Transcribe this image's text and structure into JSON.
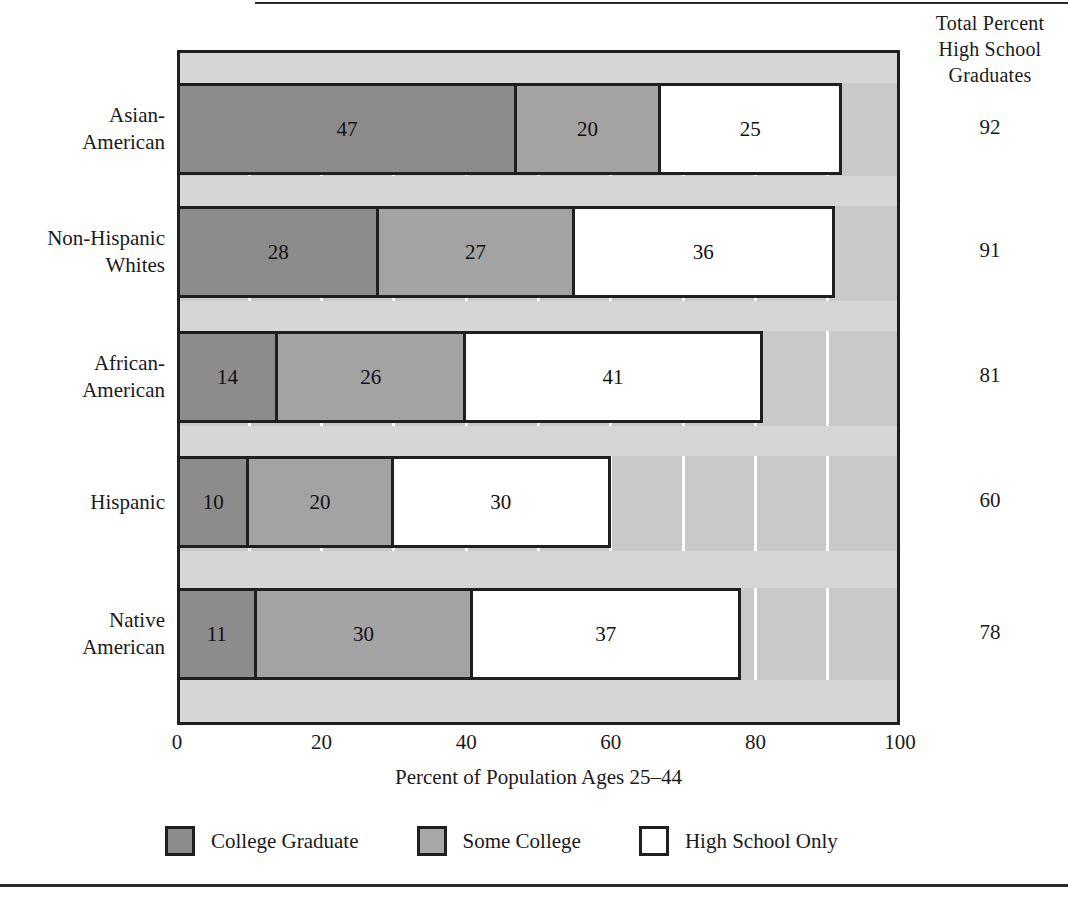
{
  "total_column": {
    "header_line1": "Total Percent",
    "header_line2": "High School",
    "header_line3": "Graduates"
  },
  "axis": {
    "xlabel": "Percent of Population Ages 25–44",
    "xticks": [
      "0",
      "20",
      "40",
      "60",
      "80",
      "100"
    ]
  },
  "legend": {
    "items": [
      {
        "label": "College Graduate",
        "swatch": "dark-gray",
        "color": "#8c8c8c"
      },
      {
        "label": "Some College",
        "swatch": "medium-gray",
        "color": "#a8a8a8"
      },
      {
        "label": "High School Only",
        "swatch": "white",
        "color": "#ffffff"
      }
    ]
  },
  "chart_data": {
    "type": "bar",
    "orientation": "horizontal",
    "stacked": true,
    "title": "",
    "xlabel": "Percent of Population Ages 25–44",
    "ylabel": "",
    "xlim": [
      0,
      100
    ],
    "xticks": [
      0,
      20,
      40,
      60,
      80,
      100
    ],
    "grid": "vertical-white-every-10",
    "legend_position": "bottom",
    "categories": [
      "Asian-\nAmerican",
      "Non-Hispanic\nWhites",
      "African-\nAmerican",
      "Hispanic",
      "Native\nAmerican"
    ],
    "series": [
      {
        "name": "College Graduate",
        "color": "#8c8c8c",
        "values": [
          47,
          28,
          14,
          10,
          11
        ]
      },
      {
        "name": "Some College",
        "color": "#a3a3a3",
        "values": [
          20,
          27,
          26,
          20,
          30
        ]
      },
      {
        "name": "High School Only",
        "color": "#ffffff",
        "values": [
          25,
          36,
          41,
          30,
          37
        ]
      }
    ],
    "totals_label": "Total Percent High School Graduates",
    "totals": [
      92,
      91,
      81,
      60,
      78
    ]
  },
  "rows": [
    {
      "label_line1": "Asian-",
      "label_line2": "American",
      "college": 47,
      "some": 20,
      "hs": 25,
      "total": 92
    },
    {
      "label_line1": "Non-Hispanic",
      "label_line2": "Whites",
      "college": 28,
      "some": 27,
      "hs": 36,
      "total": 91
    },
    {
      "label_line1": "African-",
      "label_line2": "American",
      "college": 14,
      "some": 26,
      "hs": 41,
      "total": 81
    },
    {
      "label_line1": "Hispanic",
      "label_line2": "",
      "college": 10,
      "some": 20,
      "hs": 30,
      "total": 60
    },
    {
      "label_line1": "Native",
      "label_line2": "American",
      "college": 11,
      "some": 30,
      "hs": 37,
      "total": 78
    }
  ]
}
